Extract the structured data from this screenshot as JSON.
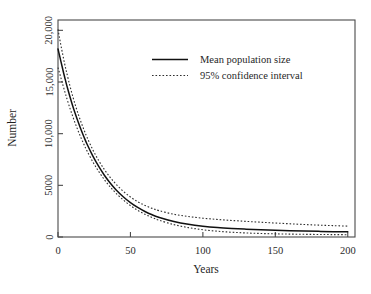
{
  "figure": {
    "caption_fragment": ""
  },
  "chart_data": {
    "type": "line",
    "title": "",
    "xlabel": "Years",
    "ylabel": "Number",
    "xlim": [
      0,
      205
    ],
    "ylim": [
      0,
      21000
    ],
    "grid": false,
    "legend_position": "top-center-right",
    "x_ticks": [
      0,
      50,
      100,
      150,
      200
    ],
    "x_tick_labels": [
      "0",
      "50",
      "100",
      "150",
      "200"
    ],
    "y_ticks": [
      0,
      5000,
      10000,
      15000,
      20000
    ],
    "y_tick_labels": [
      "0",
      "5000",
      "10,000",
      "15,000",
      "20,000"
    ],
    "legend": [
      {
        "label": "Mean population size",
        "style": "solid",
        "color": "#111111"
      },
      {
        "label": "95% confidence interval",
        "style": "dotted",
        "color": "#2e2e2e"
      }
    ],
    "x": [
      0,
      1,
      2,
      3,
      4,
      5,
      6,
      8,
      10,
      12,
      14,
      16,
      18,
      20,
      24,
      28,
      32,
      36,
      40,
      45,
      50,
      55,
      60,
      65,
      70,
      80,
      90,
      100,
      110,
      120,
      130,
      140,
      150,
      160,
      170,
      180,
      190,
      200
    ],
    "series": [
      {
        "name": "Mean population size",
        "style": "solid",
        "values": [
          18200,
          17600,
          17000,
          16400,
          15800,
          15250,
          14700,
          13700,
          12750,
          11900,
          11100,
          10350,
          9650,
          9000,
          7850,
          6850,
          5980,
          5230,
          4580,
          3900,
          3330,
          2860,
          2470,
          2150,
          1890,
          1500,
          1230,
          1050,
          920,
          830,
          760,
          700,
          650,
          610,
          575,
          545,
          520,
          500
        ]
      },
      {
        "name": "95% confidence interval upper",
        "style": "dotted",
        "values": [
          20100,
          19300,
          18550,
          17850,
          17150,
          16500,
          15900,
          14750,
          13700,
          12750,
          11880,
          11080,
          10340,
          9660,
          8450,
          7420,
          6530,
          5770,
          5120,
          4430,
          3870,
          3420,
          3060,
          2770,
          2540,
          2200,
          1980,
          1820,
          1700,
          1600,
          1510,
          1430,
          1350,
          1280,
          1210,
          1150,
          1100,
          1050
        ]
      },
      {
        "name": "95% confidence interval lower",
        "style": "dotted",
        "values": [
          16400,
          15900,
          15400,
          14900,
          14400,
          13920,
          13450,
          12570,
          11740,
          10960,
          10240,
          9560,
          8930,
          8340,
          7280,
          6360,
          5550,
          4850,
          4240,
          3590,
          3040,
          2580,
          2200,
          1880,
          1610,
          1200,
          910,
          700,
          560,
          460,
          390,
          340,
          305,
          280,
          260,
          245,
          232,
          222
        ]
      }
    ],
    "annotations": []
  },
  "geometry": {
    "plot_left": 58,
    "plot_right": 355,
    "plot_top": 20,
    "plot_bottom": 237
  }
}
